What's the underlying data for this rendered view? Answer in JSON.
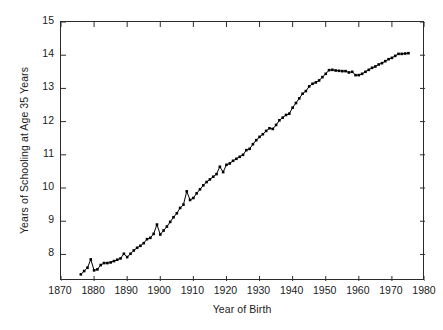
{
  "chart_data": {
    "type": "line",
    "title": "",
    "subtitle": "",
    "xlabel": "Year of Birth",
    "ylabel": "Years of Schooling at Age 35 Years",
    "xlim": [
      1870,
      1980
    ],
    "ylim": [
      7.2,
      15
    ],
    "xticks": [
      1870,
      1880,
      1890,
      1900,
      1910,
      1920,
      1930,
      1940,
      1950,
      1960,
      1970,
      1980
    ],
    "yticks": [
      8,
      9,
      10,
      11,
      12,
      13,
      14,
      15
    ],
    "grid": false,
    "legend": null,
    "marker": "square",
    "marker_color": "#000000",
    "line_color": "#000000",
    "series": [
      {
        "name": "Years of schooling at age 35",
        "x": [
          1876,
          1877,
          1878,
          1879,
          1880,
          1881,
          1882,
          1883,
          1884,
          1885,
          1886,
          1887,
          1888,
          1889,
          1890,
          1891,
          1892,
          1893,
          1894,
          1895,
          1896,
          1897,
          1898,
          1899,
          1900,
          1901,
          1902,
          1903,
          1904,
          1905,
          1906,
          1907,
          1908,
          1909,
          1910,
          1911,
          1912,
          1913,
          1914,
          1915,
          1916,
          1917,
          1918,
          1919,
          1920,
          1921,
          1922,
          1923,
          1924,
          1925,
          1926,
          1927,
          1928,
          1929,
          1930,
          1931,
          1932,
          1933,
          1934,
          1935,
          1936,
          1937,
          1938,
          1939,
          1940,
          1941,
          1942,
          1943,
          1944,
          1945,
          1946,
          1947,
          1948,
          1949,
          1950,
          1951,
          1952,
          1953,
          1954,
          1955,
          1956,
          1957,
          1958,
          1959,
          1960,
          1961,
          1962,
          1963,
          1964,
          1965,
          1966,
          1967,
          1968,
          1969,
          1970,
          1971,
          1972,
          1973,
          1974,
          1975
        ],
        "values": [
          7.4,
          7.5,
          7.6,
          7.85,
          7.52,
          7.55,
          7.68,
          7.74,
          7.74,
          7.76,
          7.8,
          7.84,
          7.88,
          8.02,
          7.92,
          8.02,
          8.12,
          8.2,
          8.26,
          8.34,
          8.46,
          8.5,
          8.62,
          8.9,
          8.6,
          8.72,
          8.84,
          8.98,
          9.12,
          9.24,
          9.4,
          9.5,
          9.9,
          9.64,
          9.7,
          9.84,
          9.96,
          10.08,
          10.18,
          10.26,
          10.34,
          10.42,
          10.64,
          10.48,
          10.7,
          10.74,
          10.82,
          10.88,
          10.94,
          11.0,
          11.14,
          11.18,
          11.32,
          11.44,
          11.54,
          11.62,
          11.72,
          11.8,
          11.78,
          11.9,
          12.04,
          12.12,
          12.2,
          12.24,
          12.42,
          12.56,
          12.7,
          12.84,
          12.92,
          13.06,
          13.14,
          13.18,
          13.24,
          13.34,
          13.44,
          13.55,
          13.56,
          13.54,
          13.53,
          13.52,
          13.52,
          13.48,
          13.5,
          13.4,
          13.4,
          13.44,
          13.5,
          13.56,
          13.62,
          13.66,
          13.72,
          13.76,
          13.82,
          13.88,
          13.92,
          13.98,
          14.04,
          14.04,
          14.05,
          14.06
        ]
      }
    ]
  }
}
